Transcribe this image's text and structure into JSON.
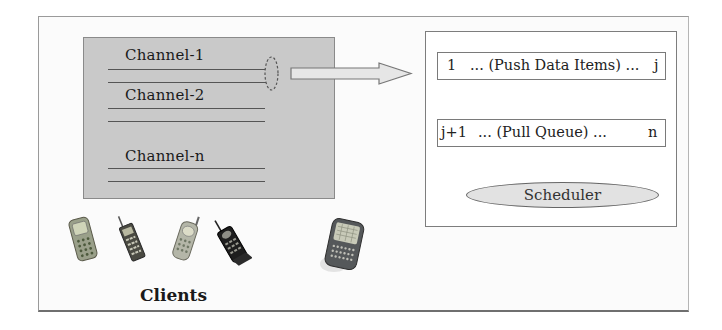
{
  "diagram": {
    "channels": [
      {
        "label": "Channel-1"
      },
      {
        "label": "Channel-2"
      },
      {
        "label": "Channel-n"
      }
    ],
    "server": {
      "push_queue": {
        "start": "1",
        "mid": "... (Push Data Items) ...",
        "end": "j"
      },
      "pull_queue": {
        "start": "j+1",
        "mid": "...  (Pull Queue) ...",
        "end": "n"
      },
      "scheduler_label": "Scheduler"
    },
    "clients": {
      "label": "Clients",
      "devices": [
        "candybar-phone-icon",
        "antenna-phone-icon",
        "flip-phone-icon",
        "black-antenna-phone-icon",
        "smartphone-pda-icon"
      ]
    },
    "colors": {
      "panel": "#c9c9c9",
      "arrow_fill": "#e6e6e6",
      "scheduler_fill": "#e2e2e2",
      "border": "#7d7d7d"
    }
  }
}
